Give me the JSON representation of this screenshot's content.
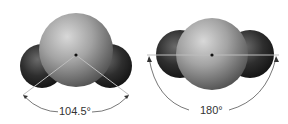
{
  "diagram": {
    "panels": [
      {
        "name": "bent-molecule",
        "shape": "bent",
        "angle_label": "104.5°",
        "central_atom_color": "#9a9a9a",
        "outer_atom_color": "#2e2e2e",
        "outer_atom_count": 2
      },
      {
        "name": "linear-molecule",
        "shape": "linear",
        "angle_label": "180°",
        "central_atom_color": "#9a9a9a",
        "outer_atom_color": "#2e2e2e",
        "outer_atom_count": 2
      }
    ]
  }
}
